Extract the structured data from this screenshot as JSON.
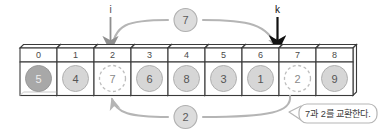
{
  "diagram": {
    "title_text": "quicksort-partition-swap-step",
    "array": {
      "indices": [
        "0",
        "1",
        "2",
        "3",
        "4",
        "5",
        "6",
        "7",
        "8"
      ],
      "values": [
        "5",
        "4",
        "7",
        "6",
        "8",
        "3",
        "1",
        "2",
        "9"
      ],
      "cell_styles": [
        "pivot",
        "filled",
        "dashed",
        "filled",
        "filled",
        "filled",
        "filled",
        "dashed",
        "filled"
      ]
    },
    "pointers": [
      {
        "name": "i",
        "label": "i",
        "index": 2,
        "color": "#8a8a8a"
      },
      {
        "name": "k",
        "label": "k",
        "index": 7,
        "color": "#1a1a1a"
      }
    ],
    "swap_arrows": [
      {
        "name": "top-arc",
        "badge": "7",
        "from_index": 2,
        "to_index": 7,
        "direction": "right"
      },
      {
        "name": "bottom-arc",
        "badge": "2",
        "from_index": 7,
        "to_index": 2,
        "direction": "left"
      }
    ],
    "callout": {
      "text": "7과 2를 교환한다."
    },
    "colors": {
      "pivot_fill": "#a8a8a8",
      "circle_fill": "#d6d6d6",
      "circle_stroke": "#b0b0b0",
      "dashed_stroke": "#bdbdbd",
      "box_stroke": "#3a3a3a",
      "arc_stroke": "#b5b5b5",
      "badge_fill": "#dcdcdc",
      "text_dark": "#3a3a3a",
      "pointer_k": "#111111",
      "pointer_i": "#8f8f8f"
    }
  }
}
